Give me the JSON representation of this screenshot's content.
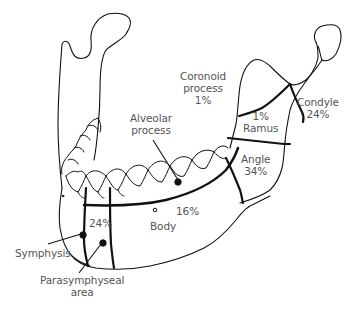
{
  "diagram": {
    "colors": {
      "line": "#111111",
      "text": "#555555",
      "background": "#ffffff"
    },
    "regions": [
      {
        "id": "coronoid",
        "name": "Coronoid process",
        "line1": "Coronoid",
        "line2": "process",
        "pct": "1%"
      },
      {
        "id": "condyle",
        "name": "Condyle",
        "line1": "Condyle",
        "pct": "24%"
      },
      {
        "id": "ramus",
        "name": "Ramus",
        "line1": "Ramus",
        "pct": "1%"
      },
      {
        "id": "angle",
        "name": "Angle",
        "line1": "Angle",
        "pct": "34%"
      },
      {
        "id": "alveolar",
        "name": "Alveolar process",
        "line1": "Alveolar",
        "line2": "process"
      },
      {
        "id": "body",
        "name": "Body",
        "line1": "Body",
        "pct": "16%"
      },
      {
        "id": "parasymphyseal",
        "name": "Parasymphyseal area",
        "line1": "Parasymphyseal",
        "line2": "area",
        "pct": "24%"
      },
      {
        "id": "symphysis",
        "name": "Symphysis",
        "line1": "Symphysis"
      }
    ]
  }
}
